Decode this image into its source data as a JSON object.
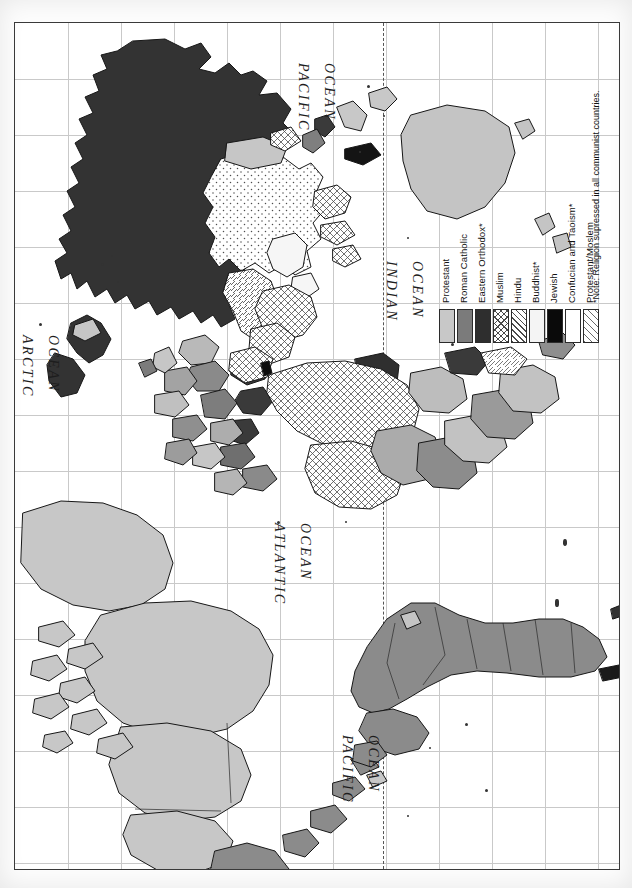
{
  "map": {
    "title": "World Religions",
    "orientation": "rotated-90",
    "frame": {
      "border_color": "#3a3a3a",
      "background": "#ffffff"
    },
    "graticule": {
      "color": "#c9c9c9",
      "visible": true
    },
    "dateline": {
      "style": "dashed",
      "color": "#555555"
    },
    "ocean_labels": [
      {
        "name": "pacific-ocean-north",
        "line1": "PACIFIC",
        "line2": "OCEAN",
        "x": 296,
        "y": 40
      },
      {
        "name": "indian-ocean",
        "line1": "INDIAN",
        "line2": "OCEAN",
        "x": 384,
        "y": 238
      },
      {
        "name": "arctic-ocean",
        "line1": "ARCTIC",
        "line2": "OCEAN",
        "x": 20,
        "y": 312
      },
      {
        "name": "atlantic-ocean",
        "line1": "ATLANTIC",
        "line2": "OCEAN",
        "x": 272,
        "y": 500
      },
      {
        "name": "pacific-ocean-south",
        "line1": "PACIFIC",
        "line2": "OCEAN",
        "x": 340,
        "y": 712
      }
    ]
  },
  "legend": {
    "items": [
      {
        "label": "Protestant",
        "fill": "f-protestant",
        "color": "#c8c8c8",
        "pattern": "solid-light-gray"
      },
      {
        "label": "Roman Catholic",
        "fill": "f-catholic",
        "color": "#7b7b7b",
        "pattern": "solid-medium-gray"
      },
      {
        "label": "Eastern Orthodox*",
        "fill": "f-orthodox",
        "color": "#2e2e2e",
        "pattern": "solid-dark-gray"
      },
      {
        "label": "Muslim",
        "fill": "f-muslim",
        "color": "#ffffff",
        "pattern": "crosshatch"
      },
      {
        "label": "Hindu",
        "fill": "f-hindu",
        "color": "#ffffff",
        "pattern": "diagonal-hatch"
      },
      {
        "label": "Buddhist*",
        "fill": "f-buddhist",
        "color": "#f4f4f4",
        "pattern": "solid-white"
      },
      {
        "label": "Jewish",
        "fill": "f-jewish",
        "color": "#0a0a0a",
        "pattern": "solid-black"
      },
      {
        "label": "Confucian and Taoism*",
        "fill": "f-confucian",
        "color": "#ffffff",
        "pattern": "stipple-dots"
      },
      {
        "label": "Protestant/Moslem",
        "fill": "f-protmoslem",
        "color": "#ffffff",
        "pattern": "wide-diagonal-hatch"
      }
    ],
    "note": "*Note: Religion supressed in all communist countries."
  }
}
